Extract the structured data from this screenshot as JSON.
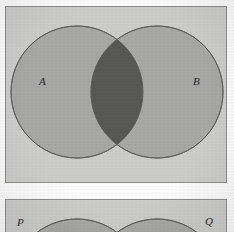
{
  "figure": {
    "background_color": "#fdfdfd"
  },
  "colors": {
    "panel_background": "#cdcdcb",
    "panel_border": "#8e8e8c",
    "circle_fill": "#a8a8a6",
    "circle_stroke": "#6d6d6b",
    "intersection_fill": "#585856",
    "label_color": "#2a2a2a"
  },
  "panels": [
    {
      "id": "panel-top",
      "x": 5,
      "y": 6,
      "width": 222,
      "height": 177,
      "sets": [
        {
          "id": "set-a",
          "label": "A",
          "cx": 71,
          "cy": 85,
          "r": 66,
          "label_x": 33,
          "label_y": 69
        },
        {
          "id": "set-b",
          "label": "B",
          "cx": 151,
          "cy": 85,
          "r": 66,
          "label_x": 187,
          "label_y": 69
        }
      ],
      "intersection": {
        "label": "",
        "shaded": true
      }
    },
    {
      "id": "panel-bottom",
      "x": 5,
      "y": 199,
      "width": 222,
      "height": 40,
      "clipped": true,
      "sets": [
        {
          "id": "set-p",
          "label": "P",
          "cx": 71,
          "cy": 85,
          "r": 66,
          "label_x": 17,
          "label_y": 217
        },
        {
          "id": "set-q",
          "label": "Q",
          "cx": 151,
          "cy": 85,
          "r": 66,
          "label_x": 205,
          "label_y": 216
        }
      ],
      "intersection": {
        "label": "",
        "shaded": true
      }
    }
  ],
  "labels": {
    "a": "A",
    "b": "B",
    "p": "P",
    "q": "Q"
  }
}
